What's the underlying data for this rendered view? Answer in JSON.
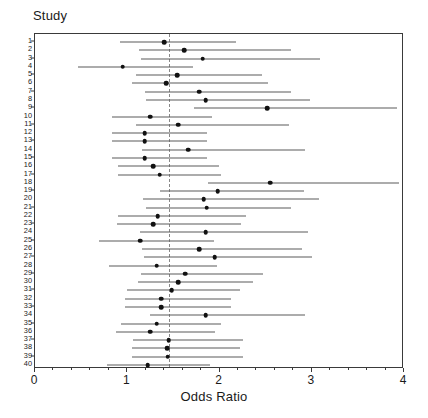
{
  "figure": {
    "study_axis_title": "Study",
    "x_axis_title": "Odds Ratio"
  },
  "chart_data": {
    "type": "scatter",
    "subtype": "forest-plot",
    "title": "",
    "xlabel": "Odds Ratio",
    "ylabel": "Study",
    "xlim": [
      0,
      4
    ],
    "xticks": [
      0,
      1,
      2,
      3,
      4
    ],
    "xticklabels": [
      "0",
      "1",
      "2",
      "3",
      "4"
    ],
    "minor_xticks": [
      0.2,
      0.4,
      0.6,
      0.8,
      1.2,
      1.4,
      1.6,
      1.8,
      2.2,
      2.4,
      2.6,
      2.8,
      3.2,
      3.4,
      3.6,
      3.8
    ],
    "grid": false,
    "legend": "none",
    "reference_line": {
      "value": 1.45,
      "style": "dashed",
      "color": "#888888"
    },
    "point_color": "#111111",
    "line_color": "#5a5a5a",
    "categories": [
      "1",
      "2",
      "3",
      "4",
      "5",
      "6",
      "7",
      "8",
      "9",
      "10",
      "11",
      "12",
      "13",
      "14",
      "15",
      "16",
      "17",
      "18",
      "19",
      "20",
      "21",
      "22",
      "23",
      "24",
      "25",
      "26",
      "27",
      "28",
      "29",
      "30",
      "31",
      "32",
      "33",
      "34",
      "35",
      "36",
      "37",
      "38",
      "39",
      "40"
    ],
    "series": [
      {
        "name": "Odds ratio with 95% CI",
        "points": [
          {
            "study": "1",
            "or": 1.4,
            "lo": 0.92,
            "hi": 2.18
          },
          {
            "study": "2",
            "or": 1.62,
            "lo": 1.13,
            "hi": 2.77
          },
          {
            "study": "3",
            "or": 1.82,
            "lo": 1.15,
            "hi": 3.09
          },
          {
            "study": "4",
            "or": 0.95,
            "lo": 0.47,
            "hi": 1.71
          },
          {
            "study": "5",
            "or": 1.54,
            "lo": 1.09,
            "hi": 2.46
          },
          {
            "study": "6",
            "or": 1.42,
            "lo": 1.05,
            "hi": 2.53
          },
          {
            "station": "",
            "study": "7",
            "or": 1.78,
            "lo": 1.19,
            "hi": 2.78
          },
          {
            "study": "8",
            "or": 1.85,
            "lo": 1.2,
            "hi": 2.98
          },
          {
            "study": "9",
            "or": 2.52,
            "lo": 1.72,
            "hi": 3.92
          },
          {
            "study": "10",
            "or": 1.25,
            "lo": 0.83,
            "hi": 1.92
          },
          {
            "study": "11",
            "or": 1.55,
            "lo": 1.1,
            "hi": 2.75
          },
          {
            "study": "12",
            "or": 1.19,
            "lo": 0.84,
            "hi": 1.86
          },
          {
            "study": "13",
            "or": 1.19,
            "lo": 0.84,
            "hi": 1.86
          },
          {
            "study": "14",
            "or": 1.66,
            "lo": 1.16,
            "hi": 2.93
          },
          {
            "study": "15",
            "or": 1.19,
            "lo": 0.83,
            "hi": 1.86
          },
          {
            "study": "16",
            "or": 1.28,
            "lo": 0.9,
            "hi": 2.0
          },
          {
            "study": "17",
            "or": 1.35,
            "lo": 0.9,
            "hi": 2.02
          },
          {
            "study": "18",
            "or": 2.55,
            "lo": 1.88,
            "hi": 3.95
          },
          {
            "study": "19",
            "or": 1.98,
            "lo": 1.35,
            "hi": 2.92
          },
          {
            "study": "20",
            "or": 1.83,
            "lo": 1.17,
            "hi": 3.08
          },
          {
            "study": "21",
            "or": 1.86,
            "lo": 1.2,
            "hi": 2.78
          },
          {
            "study": "22",
            "or": 1.33,
            "lo": 0.9,
            "hi": 2.29
          },
          {
            "study": "23",
            "or": 1.28,
            "lo": 0.89,
            "hi": 2.23
          },
          {
            "study": "24",
            "or": 1.85,
            "lo": 1.14,
            "hi": 2.96
          },
          {
            "study": "25",
            "or": 1.14,
            "lo": 0.69,
            "hi": 1.94
          },
          {
            "study": "26",
            "or": 1.78,
            "lo": 1.16,
            "hi": 2.89
          },
          {
            "study": "27",
            "or": 1.95,
            "lo": 1.18,
            "hi": 3.0
          },
          {
            "study": "28",
            "or": 1.32,
            "lo": 0.8,
            "hi": 1.97
          },
          {
            "study": "29",
            "or": 1.63,
            "lo": 1.15,
            "hi": 2.47
          },
          {
            "study": "30",
            "or": 1.55,
            "lo": 1.12,
            "hi": 2.36
          },
          {
            "study": "31",
            "or": 1.48,
            "lo": 1.0,
            "hi": 2.22
          },
          {
            "study": "32",
            "or": 1.37,
            "lo": 0.98,
            "hi": 2.12
          },
          {
            "study": "33",
            "or": 1.37,
            "lo": 0.98,
            "hi": 2.12
          },
          {
            "study": "34",
            "or": 1.85,
            "lo": 1.25,
            "hi": 2.93
          },
          {
            "study": "35",
            "or": 1.32,
            "lo": 0.93,
            "hi": 2.02
          },
          {
            "study": "36",
            "or": 1.25,
            "lo": 0.88,
            "hi": 1.95
          },
          {
            "study": "37",
            "or": 1.45,
            "lo": 1.06,
            "hi": 2.25
          },
          {
            "study": "38",
            "or": 1.43,
            "lo": 1.05,
            "hi": 2.22
          },
          {
            "study": "39",
            "or": 1.44,
            "lo": 1.05,
            "hi": 2.25
          },
          {
            "study": "40",
            "or": 1.22,
            "lo": 0.78,
            "hi": 1.9
          }
        ]
      }
    ]
  }
}
